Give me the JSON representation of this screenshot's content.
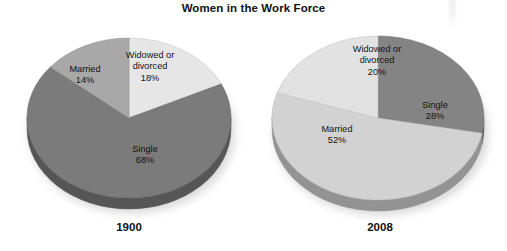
{
  "chart_data": [
    {
      "type": "pie",
      "title": "Women in the Work Force",
      "subtitle": "1900",
      "categories": [
        "Widowed or divorced",
        "Single",
        "Married"
      ],
      "values": [
        18,
        68,
        14
      ],
      "value_labels": [
        "18%",
        "68%",
        "14%"
      ],
      "colors": [
        "#e6e6e6",
        "#7b7b7b",
        "#a8a8a8"
      ],
      "start_angle_deg": 0,
      "direction": "clockwise",
      "three_d": true,
      "legend": "none",
      "xlabel": "",
      "ylabel": ""
    },
    {
      "type": "pie",
      "title": "Women in the Work Force",
      "subtitle": "2008",
      "categories": [
        "Single",
        "Married",
        "Widowed or divorced"
      ],
      "values": [
        28,
        52,
        20
      ],
      "value_labels": [
        "28%",
        "52%",
        "20%"
      ],
      "colors": [
        "#848484",
        "#d2d2d2",
        "#e2e2e2"
      ],
      "start_angle_deg": 0,
      "direction": "clockwise",
      "three_d": true,
      "legend": "none",
      "xlabel": "",
      "ylabel": ""
    }
  ],
  "header": {
    "title": "Women in the Work Force"
  },
  "pie_1900": {
    "year": "1900",
    "married": {
      "name": "Married",
      "pct": "14%"
    },
    "widowed": {
      "name": "Widowed or",
      "name2": "divorced",
      "pct": "18%"
    },
    "single": {
      "name": "Single",
      "pct": "68%"
    }
  },
  "pie_2008": {
    "year": "2008",
    "married": {
      "name": "Married",
      "pct": "52%"
    },
    "widowed": {
      "name": "Widowed or",
      "name2": "divorced",
      "pct": "20%"
    },
    "single": {
      "name": "Single",
      "pct": "28%"
    }
  }
}
